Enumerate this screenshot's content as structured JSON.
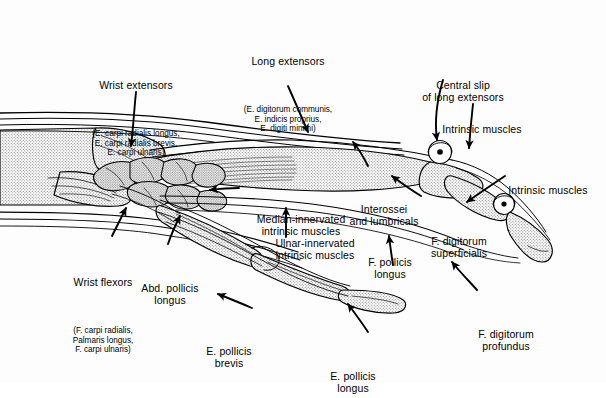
{
  "figure": {
    "colors": {
      "ink": "#000000",
      "bone_fill": "#c9c9c9",
      "background": "#fdfdfd",
      "muscle_fill": "#d8d8d8"
    }
  },
  "labels": [
    {
      "id": "wrist-extensors",
      "main": "Wrist extensors",
      "sub": "(E. carpi radialis longus,\nE. carpi radialis brevis,\nE. carpi ulnaris)"
    },
    {
      "id": "long-extensors",
      "main": "Long extensors",
      "sub": "(E. digitorum communis,\nE. indicis proprius,\nE. digiti minimi)"
    },
    {
      "id": "central-slip",
      "main": "Central slip\nof long extensors",
      "sub": ""
    },
    {
      "id": "intrinsic-muscles-upper",
      "main": "Intrinsic muscles",
      "sub": ""
    },
    {
      "id": "intrinsic-muscles-right",
      "main": "Intrinsic muscles",
      "sub": ""
    },
    {
      "id": "interossei-lumbricals",
      "main": "Interossei\nand lumbricals",
      "sub": ""
    },
    {
      "id": "median-innervated",
      "main": "Median-innervated\nintrinsic muscles",
      "sub": ""
    },
    {
      "id": "ulnar-innervated",
      "main": "Ulnar-innervated\nintrinsic muscles",
      "sub": ""
    },
    {
      "id": "f-digitorum-superficialis",
      "main": "F. digitorum\nsuperficialis",
      "sub": ""
    },
    {
      "id": "f-digitorum-profundus",
      "main": "F. digitorum\nprofundus",
      "sub": ""
    },
    {
      "id": "f-pollicis-longus",
      "main": "F. pollicis\nlongus",
      "sub": ""
    },
    {
      "id": "wrist-flexors",
      "main": "Wrist flexors",
      "sub": "(F. carpi radialis,\nPalmaris longus,\nF. carpi ulnaris)"
    },
    {
      "id": "abd-pollicis-longus",
      "main": "Abd. pollicis\nlongus",
      "sub": ""
    },
    {
      "id": "e-pollicis-brevis",
      "main": "E. pollicis\nbrevis",
      "sub": ""
    },
    {
      "id": "e-pollicis-longus",
      "main": "E. pollicis\nlongus",
      "sub": ""
    }
  ]
}
